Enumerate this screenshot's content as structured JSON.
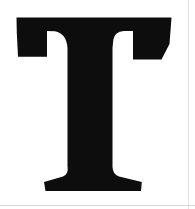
{
  "image": {
    "kind": "scanned-letterform",
    "character": "T",
    "description": "Large black serif capital letter T on a white background",
    "width": 195,
    "height": 209,
    "background_color": "#ffffff",
    "ink_color": "#0d0d0d",
    "scan_artifacts": {
      "bottom_rule_color": "#d8d8d8",
      "right_rule_color": "#e2e2e2",
      "bottom_rule_y": 205,
      "right_rule_x": 188
    }
  },
  "glyph": {
    "name": "capital-letter-t",
    "label": "T",
    "style": "serif",
    "weight": "bold",
    "fill": "#0d0d0d",
    "bounds": {
      "left": 16,
      "top": 17,
      "right": 172,
      "bottom": 191
    },
    "crossbar": {
      "top_y": 17,
      "left_x": 16,
      "right_x": 172,
      "left_arm_bottom_y": 57,
      "right_arm_bottom_y": 60,
      "right_arm_inner_x": 161
    },
    "stem": {
      "left_x": 67,
      "right_x": 112,
      "width": 45,
      "top_y": 17,
      "bottom_y": 180
    },
    "foot": {
      "left_x": 44,
      "right_x": 142,
      "top_y": 176,
      "bottom_y": 191
    },
    "path": "M 16.5 17.5 L 171.5 17.5 L 169.5 44.0 L 161.5 59.5 L 133.0 59.5 L 133.0 31.0 L 124.0 31.0 Q 114.5 31.5 113.3 40.0 L 112.5 48.0 L 112.5 167.0 Q 112.8 174.5 119.0 176.5 L 141.8 182.0 L 141.0 191.0 L 45.5 191.0 L 44.0 182.0 L 63.0 176.5 Q 68.8 174.0 67.5 166.0 L 67.5 48.0 Q 66.5 33.5 55.0 31.2 L 47.0 31.0 L 47.0 56.8 L 18.0 56.8 L 16.8 33.0 Z"
  }
}
